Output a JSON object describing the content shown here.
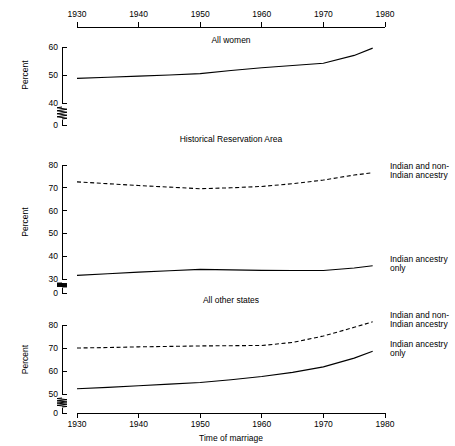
{
  "figure": {
    "xlabel": "Time of marriage",
    "ylabel": "Percent",
    "x_ticks": [
      "1930",
      "1940",
      "1950",
      "1960",
      "1970",
      "1980"
    ],
    "panels": [
      {
        "title": "All women",
        "y_ticks": [
          "0",
          "40",
          "50",
          "60"
        ],
        "series_labels": []
      },
      {
        "title": "Historical Reservation Area",
        "y_ticks": [
          "0",
          "30",
          "40",
          "50",
          "60",
          "70",
          "80"
        ],
        "series_labels": [
          "Indian and non-",
          "Indian ancestry",
          "Indian ancestry",
          "only"
        ]
      },
      {
        "title": "All other states",
        "y_ticks": [
          "0",
          "50",
          "60",
          "70",
          "80"
        ],
        "series_labels": [
          "Indian and non-",
          "Indian ancestry",
          "Indian ancestry",
          "only"
        ]
      }
    ],
    "legend": {
      "mixed_line1": "Indian and non-",
      "mixed_line2": "Indian ancestry",
      "only_line1": "Indian ancestry",
      "only_line2": "only"
    },
    "y_axis_label": "Percent"
  },
  "chart_data": {
    "type": "line",
    "title": "",
    "xlabel": "Time of marriage",
    "ylabel": "Percent",
    "xlim": [
      1930,
      1980
    ],
    "grid": false,
    "legend_position": "right-inline",
    "panels": [
      {
        "name": "All women",
        "ylim": [
          40,
          60
        ],
        "y_ticks": [
          0,
          40,
          50,
          60
        ],
        "axis_break": true,
        "series": [
          {
            "name": "All women",
            "style": "solid",
            "x": [
              1930,
              1935,
              1940,
              1945,
              1950,
              1955,
              1960,
              1965,
              1970,
              1975,
              1978
            ],
            "values": [
              48.8,
              49.2,
              49.6,
              50.0,
              50.5,
              51.6,
              52.6,
              53.4,
              54.2,
              57.0,
              59.6
            ]
          }
        ]
      },
      {
        "name": "Historical Reservation Area",
        "ylim": [
          30,
          80
        ],
        "y_ticks": [
          0,
          30,
          40,
          50,
          60,
          70,
          80
        ],
        "axis_break": true,
        "series": [
          {
            "name": "Indian and non-Indian ancestry",
            "style": "dashed",
            "x": [
              1930,
              1935,
              1940,
              1945,
              1950,
              1955,
              1960,
              1965,
              1970,
              1975,
              1978
            ],
            "values": [
              72.6,
              71.8,
              71.0,
              70.3,
              69.6,
              70.0,
              70.6,
              71.8,
              73.4,
              75.6,
              76.6
            ]
          },
          {
            "name": "Indian ancestry only",
            "style": "solid",
            "x": [
              1930,
              1935,
              1940,
              1945,
              1950,
              1955,
              1960,
              1965,
              1970,
              1975,
              1978
            ],
            "values": [
              31.6,
              32.3,
              33.0,
              33.6,
              34.2,
              34.0,
              33.8,
              33.7,
              33.7,
              34.8,
              35.8
            ]
          }
        ]
      },
      {
        "name": "All other states",
        "ylim": [
          50,
          80
        ],
        "y_ticks": [
          0,
          50,
          60,
          70,
          80
        ],
        "axis_break": true,
        "series": [
          {
            "name": "Indian and non-Indian ancestry",
            "style": "dashed",
            "x": [
              1930,
              1935,
              1940,
              1945,
              1950,
              1955,
              1960,
              1965,
              1970,
              1975,
              1978
            ],
            "values": [
              70.0,
              70.2,
              70.5,
              70.7,
              70.9,
              71.0,
              71.1,
              72.4,
              75.2,
              79.0,
              81.4
            ]
          },
          {
            "name": "Indian ancestry only",
            "style": "solid",
            "x": [
              1930,
              1935,
              1940,
              1945,
              1950,
              1955,
              1960,
              1965,
              1970,
              1975,
              1978
            ],
            "values": [
              52.3,
              52.9,
              53.6,
              54.3,
              55.0,
              56.2,
              57.6,
              59.4,
              61.8,
              65.6,
              68.6
            ]
          }
        ]
      }
    ]
  }
}
